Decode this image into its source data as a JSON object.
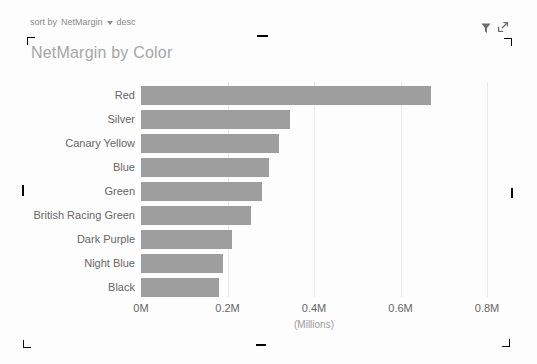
{
  "header": {
    "sort": {
      "prefix": "sort by",
      "field": "NetMargin",
      "direction": "desc"
    },
    "title": "NetMargin by Color",
    "icons": [
      {
        "name": "filter-icon"
      },
      {
        "name": "focus-mode-icon"
      }
    ]
  },
  "chart_data": {
    "type": "bar",
    "orientation": "horizontal",
    "title": "NetMargin by Color",
    "series_name": "NetMargin",
    "categories": [
      "Red",
      "Silver",
      "Canary Yellow",
      "Blue",
      "Green",
      "British Racing Green",
      "Dark Purple",
      "Night Blue",
      "Black"
    ],
    "values": [
      0.67,
      0.345,
      0.32,
      0.295,
      0.28,
      0.255,
      0.21,
      0.19,
      0.18
    ],
    "value_unit": "Millions",
    "xlabel": "(Millions)",
    "x_ticks": [
      {
        "label": "0M",
        "value": 0.0
      },
      {
        "label": "0.2M",
        "value": 0.2
      },
      {
        "label": "0.4M",
        "value": 0.4
      },
      {
        "label": "0.6M",
        "value": 0.6
      },
      {
        "label": "0.8M",
        "value": 0.8
      }
    ],
    "xlim": [
      0,
      0.8
    ],
    "grid": true,
    "legend": false,
    "sort": "desc",
    "bar_color": "#9e9e9e"
  },
  "colors": {
    "background": "#fdfdfd",
    "bar": "#9e9e9e",
    "title": "#a6a6a6",
    "axis_text": "#666666",
    "unit_text": "#9b9b9b",
    "grid": "#ebebeb",
    "frame": "#9a9a9a",
    "sort_text": "#8a8a8a",
    "icon": "#6e6e6e"
  }
}
